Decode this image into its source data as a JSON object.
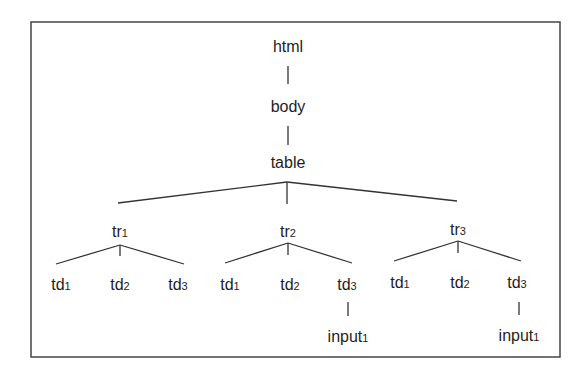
{
  "diagram": {
    "type": "tree",
    "frame": {
      "x": 31,
      "y": 22,
      "w": 529,
      "h": 335
    },
    "colors": {
      "line": "#333333",
      "text": "#1e1e1e",
      "background": "#ffffff"
    },
    "nodes": [
      {
        "id": "html",
        "label": "html",
        "sub": "",
        "x": 288,
        "y": 52
      },
      {
        "id": "body",
        "label": "body",
        "sub": "",
        "x": 288,
        "y": 112
      },
      {
        "id": "table",
        "label": "table",
        "sub": "",
        "x": 288,
        "y": 168
      },
      {
        "id": "tr1",
        "label": "tr",
        "sub": "1",
        "x": 120,
        "y": 237
      },
      {
        "id": "tr2",
        "label": "tr",
        "sub": "2",
        "x": 288,
        "y": 237
      },
      {
        "id": "tr3",
        "label": "tr",
        "sub": "3",
        "x": 458,
        "y": 235
      },
      {
        "id": "tr1_td1",
        "label": "td",
        "sub": "1",
        "x": 61,
        "y": 290
      },
      {
        "id": "tr1_td2",
        "label": "td",
        "sub": "2",
        "x": 120,
        "y": 290
      },
      {
        "id": "tr1_td3",
        "label": "td",
        "sub": "3",
        "x": 178,
        "y": 290
      },
      {
        "id": "tr2_td1",
        "label": "td",
        "sub": "1",
        "x": 230,
        "y": 290
      },
      {
        "id": "tr2_td2",
        "label": "td",
        "sub": "2",
        "x": 290,
        "y": 290
      },
      {
        "id": "tr2_td3",
        "label": "td",
        "sub": "3",
        "x": 347,
        "y": 290
      },
      {
        "id": "tr3_td1",
        "label": "td",
        "sub": "1",
        "x": 400,
        "y": 288
      },
      {
        "id": "tr3_td2",
        "label": "td",
        "sub": "2",
        "x": 460,
        "y": 288
      },
      {
        "id": "tr3_td3",
        "label": "td",
        "sub": "3",
        "x": 517,
        "y": 288
      },
      {
        "id": "tr2_input1",
        "label": "input",
        "sub": "1",
        "x": 348,
        "y": 342
      },
      {
        "id": "tr3_input1",
        "label": "input",
        "sub": "1",
        "x": 519,
        "y": 341
      }
    ],
    "edges": [
      {
        "from": "html",
        "to": "body",
        "x1": 288,
        "y1": 66,
        "x2": 288,
        "y2": 84
      },
      {
        "from": "body",
        "to": "table",
        "x1": 288,
        "y1": 126,
        "x2": 288,
        "y2": 145
      },
      {
        "from": "table",
        "to": "tr1",
        "x1": 287,
        "y1": 182,
        "x2": 118,
        "y2": 203
      },
      {
        "from": "table",
        "to": "tr2",
        "x1": 287,
        "y1": 182,
        "x2": 287,
        "y2": 204
      },
      {
        "from": "table",
        "to": "tr3",
        "x1": 287,
        "y1": 182,
        "x2": 457,
        "y2": 201
      },
      {
        "from": "tr1",
        "to": "tr1_td1",
        "x1": 120,
        "y1": 245,
        "x2": 56,
        "y2": 264
      },
      {
        "from": "tr1",
        "to": "tr1_td2",
        "x1": 120,
        "y1": 245,
        "x2": 120,
        "y2": 256
      },
      {
        "from": "tr1",
        "to": "tr1_td3",
        "x1": 120,
        "y1": 245,
        "x2": 184,
        "y2": 264
      },
      {
        "from": "tr2",
        "to": "tr2_td1",
        "x1": 288,
        "y1": 243,
        "x2": 225,
        "y2": 263
      },
      {
        "from": "tr2",
        "to": "tr2_td2",
        "x1": 288,
        "y1": 243,
        "x2": 288,
        "y2": 255
      },
      {
        "from": "tr2",
        "to": "tr2_td3",
        "x1": 288,
        "y1": 243,
        "x2": 352,
        "y2": 263
      },
      {
        "from": "tr3",
        "to": "tr3_td1",
        "x1": 458,
        "y1": 241,
        "x2": 394,
        "y2": 261
      },
      {
        "from": "tr3",
        "to": "tr3_td2",
        "x1": 458,
        "y1": 241,
        "x2": 458,
        "y2": 253
      },
      {
        "from": "tr3",
        "to": "tr3_td3",
        "x1": 458,
        "y1": 241,
        "x2": 521,
        "y2": 261
      },
      {
        "from": "tr2_td3",
        "to": "tr2_input1",
        "x1": 348,
        "y1": 302,
        "x2": 348,
        "y2": 316
      },
      {
        "from": "tr3_td3",
        "to": "tr3_input1",
        "x1": 519,
        "y1": 302,
        "x2": 519,
        "y2": 315
      }
    ]
  }
}
